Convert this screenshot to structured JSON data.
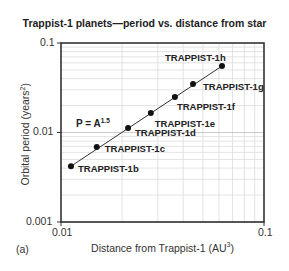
{
  "chart_data": {
    "type": "scatter",
    "title": "Trappist-1 planets—period vs. distance from star",
    "xlabel": "Distance from Trappist-1 (AU³)",
    "xlabel_base": "Distance from Trappist-1 (AU",
    "xlabel_sup": "3",
    "ylabel": "Orbital period (years²)",
    "ylabel_base": "Orbital period (years",
    "ylabel_sup": "2",
    "xscale": "log",
    "yscale": "log",
    "xlim": [
      0.01,
      0.1
    ],
    "ylim": [
      0.001,
      0.1
    ],
    "x_ticks": [
      "0.01",
      "0.1"
    ],
    "y_ticks": [
      "0.1",
      "0.01",
      "0.001"
    ],
    "grid": true,
    "legend": null,
    "annotation": {
      "base": "P = A",
      "sup": "1.5"
    },
    "panel_label": "(a)",
    "fit_line": true,
    "series": [
      {
        "name": "Trappist-1 planets",
        "points": [
          {
            "label": "TRAPPIST-1b",
            "x": 0.0112,
            "y": 0.0042
          },
          {
            "label": "TRAPPIST-1c",
            "x": 0.015,
            "y": 0.0069
          },
          {
            "label": "TRAPPIST-1d",
            "x": 0.0214,
            "y": 0.0112
          },
          {
            "label": "TRAPPIST-1e",
            "x": 0.0277,
            "y": 0.0165
          },
          {
            "label": "TRAPPIST-1f",
            "x": 0.0364,
            "y": 0.0249
          },
          {
            "label": "TRAPPIST-1g",
            "x": 0.0447,
            "y": 0.0348
          },
          {
            "label": "TRAPPIST-1h",
            "x": 0.0621,
            "y": 0.0553
          }
        ]
      }
    ]
  }
}
